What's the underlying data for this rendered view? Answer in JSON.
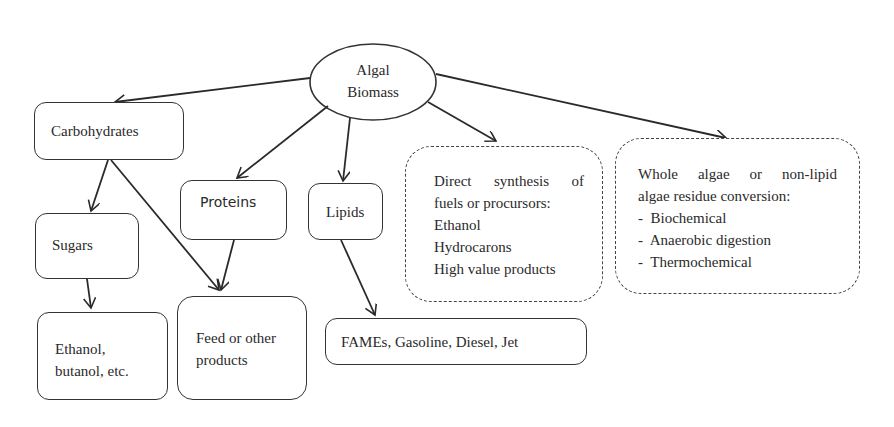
{
  "diagram": {
    "root": {
      "line1": "Algal",
      "line2": "Biomass"
    },
    "carbohydrates": {
      "label": "Carbohydrates"
    },
    "proteins": {
      "label": "Proteins"
    },
    "lipids": {
      "label": "Lipids"
    },
    "sugars": {
      "label": "Sugars"
    },
    "ethanol_butanol": {
      "line1": "Ethanol,",
      "line2": "butanol, etc."
    },
    "feed": {
      "line1": "Feed or other",
      "line2": "products"
    },
    "fames": {
      "label": "FAMEs, Gasoline, Diesel, Jet"
    },
    "direct_synthesis": {
      "lines": [
        "Direct synthesis of",
        "fuels or procursors:",
        "Ethanol",
        "Hydrocarons",
        "High value products"
      ]
    },
    "whole_algae": {
      "lines": [
        "Whole algae or non-lipid",
        "algae residue conversion:",
        "-  Biochemical",
        "-  Anaerobic digestion",
        "-  Thermochemical"
      ]
    },
    "edges": [
      {
        "from": "Algal Biomass",
        "to": "Carbohydrates"
      },
      {
        "from": "Algal Biomass",
        "to": "Proteins"
      },
      {
        "from": "Algal Biomass",
        "to": "Lipids"
      },
      {
        "from": "Algal Biomass",
        "to": "Direct synthesis of fuels or procursors"
      },
      {
        "from": "Algal Biomass",
        "to": "Whole algae or non-lipid algae residue conversion"
      },
      {
        "from": "Carbohydrates",
        "to": "Sugars"
      },
      {
        "from": "Carbohydrates",
        "to": "Feed or other products"
      },
      {
        "from": "Proteins",
        "to": "Feed or other products"
      },
      {
        "from": "Sugars",
        "to": "Ethanol, butanol, etc."
      },
      {
        "from": "Lipids",
        "to": "FAMEs, Gasoline, Diesel, Jet"
      }
    ],
    "colors": {
      "stroke": "#333333",
      "text": "#2a2a2a",
      "background": "#ffffff"
    }
  }
}
